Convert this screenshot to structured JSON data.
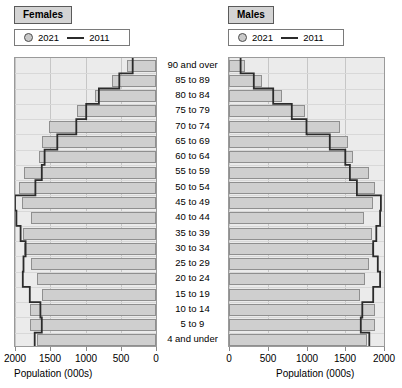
{
  "panels": {
    "left": {
      "title": "Females"
    },
    "right": {
      "title": "Males"
    }
  },
  "legend": {
    "series_2021_label": "2021",
    "series_2011_label": "2011",
    "marker_2021": "ring-marker",
    "marker_2011": "line-marker"
  },
  "axis": {
    "title": "Population (000s)",
    "ticks": [
      "0",
      "500",
      "1000",
      "1500",
      "2000"
    ],
    "ticks_reversed": [
      "2000",
      "1500",
      "1000",
      "500",
      "0"
    ],
    "max": 2000
  },
  "colors": {
    "bar_fill_2021": "#cfcfcf",
    "bar_stroke_2021": "#8f8f8f",
    "line_2011": "#2b2b2b",
    "panel_background": "#ebebeb",
    "gridline": "#c6c6c6",
    "title_background": "#d4d4d4"
  },
  "chart_data": {
    "type": "bar",
    "title": "",
    "subtitle": "",
    "xlabel": "Population (000s)",
    "ylabel": "",
    "orientation": "horizontal",
    "layout": "population-pyramid",
    "xlim": [
      0,
      2000
    ],
    "grid": true,
    "legend_position": "top",
    "categories": [
      "90 and over",
      "85 to 89",
      "80 to 84",
      "75 to 79",
      "70 to 74",
      "65 to 69",
      "60 to 64",
      "55 to 59",
      "50 to 54",
      "45 to 49",
      "40 to 44",
      "35 to 39",
      "30 to 34",
      "25 to 29",
      "20 to 24",
      "15 to 19",
      "10 to 14",
      "5 to 9",
      "4 and under"
    ],
    "panels": [
      {
        "name": "Females",
        "side": "left",
        "series": [
          {
            "name": "2021",
            "values": [
              410,
              620,
              860,
              1120,
              1520,
              1610,
              1660,
              1870,
              1940,
              1900,
              1770,
              1880,
              1870,
              1780,
              1690,
              1610,
              1790,
              1790,
              1690
            ]
          },
          {
            "name": "2011",
            "values": [
              330,
              520,
              810,
              990,
              1130,
              1400,
              1580,
              1620,
              1710,
              2000,
              1980,
              1920,
              1850,
              1880,
              1890,
              1790,
              1640,
              1620,
              1720
            ]
          }
        ]
      },
      {
        "name": "Males",
        "side": "right",
        "series": [
          {
            "name": "2021",
            "values": [
              210,
              430,
              680,
              980,
              1430,
              1540,
              1600,
              1810,
              1880,
              1860,
              1740,
              1840,
              1860,
              1810,
              1760,
              1690,
              1880,
              1880,
              1780
            ]
          },
          {
            "name": "2011",
            "values": [
              150,
              320,
              570,
              810,
              1000,
              1300,
              1500,
              1560,
              1650,
              1960,
              1950,
              1900,
              1860,
              1920,
              1950,
              1860,
              1720,
              1700,
              1810
            ]
          }
        ]
      }
    ]
  }
}
